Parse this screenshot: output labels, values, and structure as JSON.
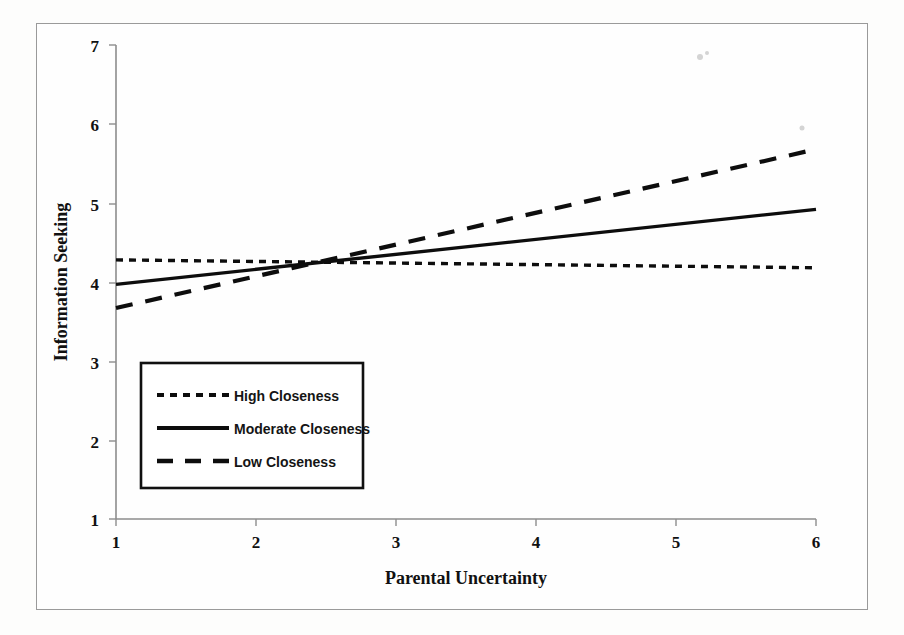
{
  "figure": {
    "background_color": "#fdfdfc",
    "frame_color": "#9a9a9a",
    "axis_color": "#8d8d8d",
    "line_color": "#0d0d0d"
  },
  "chart_data": {
    "type": "line",
    "title": "",
    "xlabel": "Parental Uncertainty",
    "ylabel": "Information Seeking",
    "xlim": [
      1,
      6
    ],
    "ylim": [
      1,
      7
    ],
    "xticks": [
      "1",
      "2",
      "3",
      "4",
      "5",
      "6"
    ],
    "yticks": [
      "1",
      "2",
      "3",
      "4",
      "5",
      "6",
      "7"
    ],
    "grid": false,
    "legend_position": "lower-left-inside",
    "x": [
      1,
      6
    ],
    "series": [
      {
        "name": "High Closeness",
        "style": "dotted",
        "values": [
          4.28,
          4.18
        ]
      },
      {
        "name": "Moderate Closeness",
        "style": "solid",
        "values": [
          3.97,
          4.92
        ]
      },
      {
        "name": "Low Closeness",
        "style": "dashed",
        "values": [
          3.67,
          5.68
        ]
      }
    ],
    "annotations": []
  },
  "legend": {
    "entries": [
      {
        "label": "High Closeness",
        "style": "dotted"
      },
      {
        "label": "Moderate Closeness",
        "style": "solid"
      },
      {
        "label": "Low Closeness",
        "style": "dashed"
      }
    ]
  }
}
